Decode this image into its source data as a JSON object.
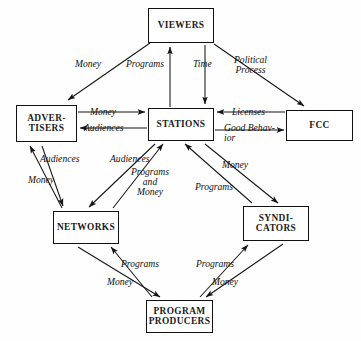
{
  "diagram": {
    "nodes": [
      {
        "id": "viewers",
        "label": "VIEWERS"
      },
      {
        "id": "advertisers",
        "label_line1": "ADVER-",
        "label_line2": "TISERS"
      },
      {
        "id": "stations",
        "label": "STATIONS"
      },
      {
        "id": "fcc",
        "label": "FCC"
      },
      {
        "id": "networks",
        "label": "NETWORKS"
      },
      {
        "id": "syndicators",
        "label_line1": "SYNDI-",
        "label_line2": "CATORS"
      },
      {
        "id": "producers",
        "label_line1": "PROGRAM",
        "label_line2": "PRODUCERS"
      }
    ],
    "edge_labels": {
      "money_advertisers_from_viewers": "Money",
      "programs_to_viewers": "Programs",
      "time_from_viewers": "Time",
      "political_process_line1": "Political",
      "political_process_line2": "Process",
      "money_advertisers_to_stations": "Money",
      "audiences_stations_to_advertisers": "Audiences",
      "licenses_fcc_to_stations": "Licenses",
      "good_behavior_line1": "Good Behav-",
      "good_behavior_line2": "ior",
      "audiences_networks_to_advertisers": "Audiences",
      "money_advertisers_to_networks": "Money",
      "audiences_stations_to_networks": "Audiences",
      "programs_and_money_line1": "Programs",
      "programs_and_money_line2": "and",
      "programs_and_money_line3": "Money",
      "money_stations_to_syndicators": "Money",
      "programs_syndicators_to_stations": "Programs",
      "programs_producers_to_networks": "Programs",
      "money_networks_to_producers": "Money",
      "programs_producers_to_syndicators": "Programs",
      "money_syndicators_to_producers": "Money"
    },
    "caption": ""
  },
  "style": {
    "line_color": "#151515",
    "box_border": "#111111",
    "background": "#fefefe"
  }
}
